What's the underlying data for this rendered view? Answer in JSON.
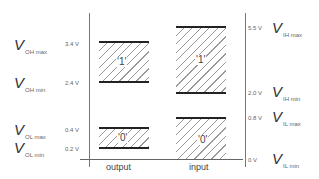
{
  "diagram": {
    "columns": {
      "output": "output",
      "input": "input"
    },
    "output_levels": [
      {
        "symbol": "V",
        "subscript": "OH max",
        "voltage": "3.4 V"
      },
      {
        "symbol": "V",
        "subscript": "OH min",
        "voltage": "2.4 V"
      },
      {
        "symbol": "V",
        "subscript": "OL max",
        "voltage": "0.4 V"
      },
      {
        "symbol": "V",
        "subscript": "OL min",
        "voltage": "0.2 V"
      }
    ],
    "input_levels": [
      {
        "symbol": "V",
        "subscript": "IH max",
        "voltage": "5.5 V"
      },
      {
        "symbol": "V",
        "subscript": "IH min",
        "voltage": "2.0 V"
      },
      {
        "symbol": "V",
        "subscript": "IL max",
        "voltage": "0.8 V"
      },
      {
        "symbol": "V",
        "subscript": "IL min",
        "voltage": "0 V"
      }
    ],
    "regions": {
      "output_high": "'1'",
      "output_low": "'0'",
      "input_high": "'1'",
      "input_low": "'0'"
    }
  }
}
